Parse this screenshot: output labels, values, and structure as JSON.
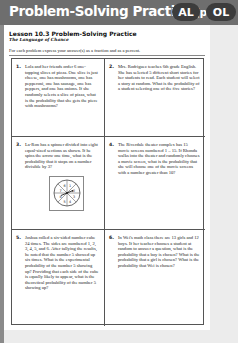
{
  "header": {
    "title": "Problem-Solving Practice",
    "page_ref": "(p. 31)",
    "badges": [
      "AL",
      "OL"
    ],
    "color": "#6e6e6e",
    "badge_color": "#3c3c3c"
  },
  "lesson": {
    "title": "Lesson 10.3 Problem-Solving Practice",
    "subtitle": "The Language of Chance",
    "instruction": "For each problem express your answer(s) as a fraction and as a percent."
  },
  "problems": [
    {
      "number": "1.",
      "text": "Lola and her friends order 6 one-topping slices of pizza. One slice is just cheese, one has mushrooms, one has pepperoni, one has sausage, one has peppers, and one has onions. If she randomly selects a slice of pizza, what is the probability that she gets the piece with mushrooms?"
    },
    {
      "number": "2.",
      "text": "Mrs. Rodriguez teaches 6th grade English. She has selected 5 different short stories for her students to read. Each student will select a story at random. What is the probability of a student selecting one of the five stories?"
    },
    {
      "number": "3.",
      "text": "La-Ron has a spinner divided into eight equal-sized sections as shown. If he spins the arrow one time, what is the probability that it stops on a number divisible by 3?",
      "spinner": {
        "sections": [
          "1",
          "2",
          "3",
          "4",
          "5",
          "6",
          "7",
          "8"
        ]
      }
    },
    {
      "number": "4.",
      "text": "The Riverdale theater complex has 15 movie screens numbered 1 – 15. If Rhonda walks into the theater and randomly chooses a movie screen, what is the probability that she will choose one of the movie screens with a number greater than 10?"
    },
    {
      "number": "5.",
      "text": "Joshua rolled a six-sided number cube 24 times. The sides are numbered 1, 2, 3, 4, 5, and 6. After tallying the results, he noted that the number 5 showed up six times. What is the experimental probability of the number 5 showing up? Providing that each side of the cube is equally likely to appear, what is the theoretical probability of the number 5 showing up?"
    },
    {
      "number": "6.",
      "text": "In Wei's math class there are 13 girls and 12 boys. If her teacher chooses a student at random to answer a question, what is the probability that a boy is chosen? What is the probability that a girl is chosen? What is the probability that Wei is chosen?"
    }
  ]
}
